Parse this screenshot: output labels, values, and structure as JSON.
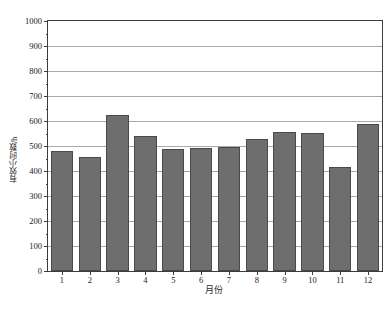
{
  "chart_data": {
    "type": "bar",
    "title": "",
    "xlabel": "月份",
    "ylabel": "有效小时数/h",
    "categories": [
      "1",
      "2",
      "3",
      "4",
      "5",
      "6",
      "7",
      "8",
      "9",
      "10",
      "11",
      "12"
    ],
    "values": [
      480,
      458,
      625,
      540,
      488,
      492,
      498,
      528,
      558,
      552,
      415,
      590
    ],
    "series": [
      {
        "name": "有效小时数",
        "values": [
          480,
          458,
          625,
          540,
          488,
          492,
          498,
          528,
          558,
          552,
          415,
          590
        ]
      }
    ],
    "ylim": [
      0,
      1000
    ],
    "ytick_values": [
      0,
      100,
      200,
      300,
      400,
      500,
      600,
      700,
      800,
      900,
      1000
    ],
    "ytick_labels": [
      "0",
      "100",
      "200",
      "300",
      "400",
      "500",
      "600",
      "700",
      "800",
      "900",
      "1000"
    ],
    "y_minor_interval": 50,
    "grid": "horizontal-major",
    "legend": "none",
    "bar_color": "#6e6e6e",
    "bar_edge_color": "#4a4a4a",
    "grid_color": "#a9a9a9",
    "axis_color": "#3c3c3c"
  },
  "figure": {
    "caption": ""
  }
}
